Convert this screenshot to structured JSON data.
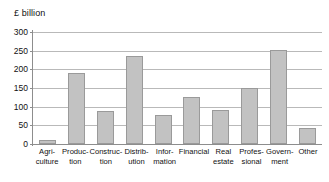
{
  "chart_data": {
    "type": "bar",
    "title": "",
    "unit_label": "£ billion",
    "xlabel": "",
    "ylabel": "£ billion",
    "ylim": [
      0,
      300
    ],
    "yticks": [
      0,
      50,
      100,
      150,
      200,
      250,
      300
    ],
    "ytick_labels": [
      "0",
      "50",
      "100",
      "150",
      "200",
      "250",
      "300"
    ],
    "grid": true,
    "legend": false,
    "categories": [
      "Agriculture",
      "Production",
      "Construction",
      "Distribution",
      "Information",
      "Financial",
      "Real estate",
      "Professional",
      "Government",
      "Other"
    ],
    "category_label_lines": [
      [
        "Agri-",
        "culture"
      ],
      [
        "Produc-",
        "tion"
      ],
      [
        "Construc-",
        "tion"
      ],
      [
        "Distrib-",
        "ution"
      ],
      [
        "Infor-",
        "mation"
      ],
      [
        "Financial",
        ""
      ],
      [
        "Real",
        "estate"
      ],
      [
        "Profes-",
        "sional"
      ],
      [
        "Govern-",
        "ment"
      ],
      [
        "Other",
        ""
      ]
    ],
    "values": [
      10,
      190,
      88,
      236,
      78,
      127,
      91,
      150,
      253,
      43
    ],
    "bar_color": "#c2c2c2",
    "bar_border_color": "#9a9a9a",
    "grid_color": "#b9b9b9",
    "axis_color": "#8d8d8d",
    "text_color": "#111111",
    "background_color": "#ffffff"
  }
}
